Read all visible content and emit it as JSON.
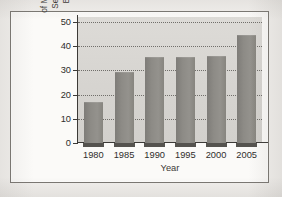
{
  "figure": {
    "background_color": "#f2f0ed",
    "frame_color": "#7a7772",
    "plot_background_color": "#d9d7d3",
    "bar_color": "#8b8984",
    "bar_base_color": "#55534f",
    "axis_color": "#3c3a37",
    "gridline_color": "#5f5d59"
  },
  "axis_titles": {
    "y_line1": "Exports of Commercial",
    "y_line2": "Services as a Percentage",
    "y_line3": "of Merchandise Exports (%)",
    "x": "Year"
  },
  "chart_data": {
    "type": "bar",
    "title": "",
    "xlabel": "Year",
    "ylabel": "Exports of Commercial Services as a Percentage of Merchandise Exports (%)",
    "categories": [
      "1980",
      "1985",
      "1990",
      "1995",
      "2000",
      "2005"
    ],
    "values": [
      17,
      29.5,
      35.5,
      35.5,
      36,
      44.5
    ],
    "ylim": [
      0,
      52
    ],
    "yticks": [
      0,
      10,
      20,
      30,
      40,
      50
    ],
    "ytick_labels": [
      "0",
      "10",
      "20",
      "30",
      "40",
      "50"
    ],
    "grid": true,
    "grid_style": "dotted-horizontal",
    "legend": "none"
  }
}
